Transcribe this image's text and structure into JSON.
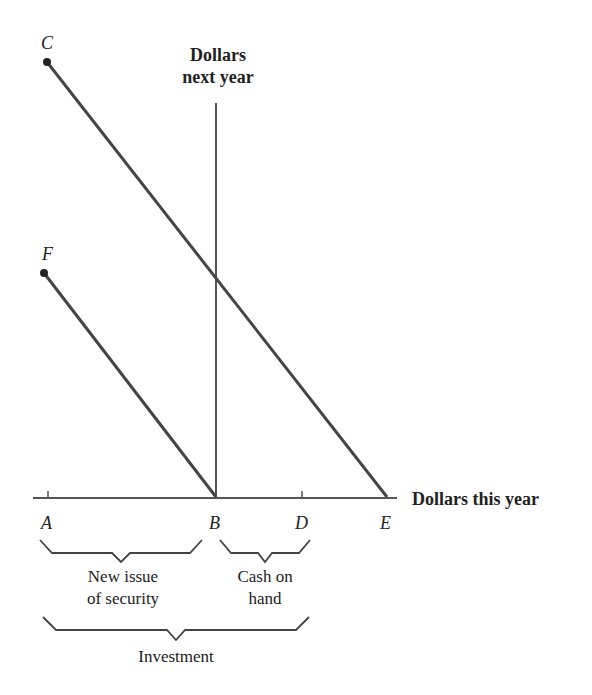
{
  "points": {
    "C": "C",
    "F": "F",
    "A": "A",
    "B": "B",
    "D": "D",
    "E": "E"
  },
  "axes": {
    "y_label_line1": "Dollars",
    "y_label_line2": "next year",
    "x_label": "Dollars this year"
  },
  "braces": {
    "new_issue_line1": "New issue",
    "new_issue_line2": "of security",
    "cash_line1": "Cash on",
    "cash_line2": "hand",
    "investment": "Investment"
  },
  "colors": {
    "line": "#444444",
    "axis": "#555555",
    "text": "#222222"
  }
}
